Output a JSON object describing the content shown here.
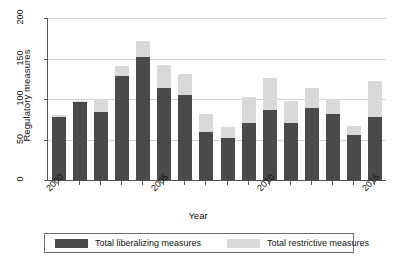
{
  "chart_data": {
    "type": "bar",
    "subtype": "stacked",
    "title": "",
    "xlabel": "Year",
    "ylabel": "Regulatory measures",
    "ylim": [
      0,
      200
    ],
    "yticks": [
      0,
      50,
      100,
      150,
      200
    ],
    "grid": true,
    "legend_position": "bottom",
    "categories": [
      "2000",
      "2001",
      "2002",
      "2003",
      "2004",
      "2005",
      "2006",
      "2007",
      "2008",
      "2009",
      "2010",
      "2011",
      "2012",
      "2013",
      "2014",
      "2015"
    ],
    "xtick_labels": [
      "2000",
      "2005",
      "2010",
      "2015"
    ],
    "series": [
      {
        "name": "Total liberalizing measures",
        "color": "#4a4a4a",
        "values": [
          78,
          96,
          84,
          129,
          152,
          113,
          105,
          59,
          52,
          71,
          86,
          71,
          89,
          82,
          55,
          78
        ]
      },
      {
        "name": "Total restrictive measures",
        "color": "#d9d9d9",
        "values": [
          2,
          1,
          16,
          12,
          20,
          29,
          26,
          23,
          13,
          31,
          40,
          26,
          24,
          18,
          12,
          44
        ]
      }
    ],
    "totals": [
      80,
      97,
      100,
      141,
      172,
      142,
      131,
      82,
      65,
      102,
      126,
      97,
      113,
      100,
      67,
      122
    ]
  },
  "legend": {
    "items": [
      {
        "label": "Total liberalizing measures",
        "color": "#4a4a4a"
      },
      {
        "label": "Total restrictive measures",
        "color": "#d9d9d9"
      }
    ]
  }
}
